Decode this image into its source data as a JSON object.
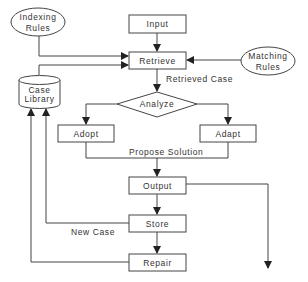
{
  "diagram": {
    "title": "",
    "nodes": {
      "input": {
        "label": "Input",
        "shape": "rect"
      },
      "retrieve": {
        "label": "Retrieve",
        "shape": "rect"
      },
      "indexing_rules": {
        "label_line1": "Indexing",
        "label_line2": "Rules",
        "shape": "ellipse"
      },
      "matching_rules": {
        "label_line1": "Matching",
        "label_line2": "Rules",
        "shape": "ellipse"
      },
      "case_library": {
        "label_line1": "Case",
        "label_line2": "Library",
        "shape": "cylinder"
      },
      "analyze": {
        "label": "Analyze",
        "shape": "diamond"
      },
      "adopt": {
        "label": "Adopt",
        "shape": "rect"
      },
      "adapt": {
        "label": "Adapt",
        "shape": "rect"
      },
      "output": {
        "label": "Output",
        "shape": "rect"
      },
      "store": {
        "label": "Store",
        "shape": "rect"
      },
      "repair": {
        "label": "Repair",
        "shape": "rect"
      }
    },
    "edge_labels": {
      "retrieved_case": "Retrieved Case",
      "propose_solution": "Propose Solution",
      "new_case": "New Case"
    },
    "edges": [
      {
        "from": "input",
        "to": "retrieve"
      },
      {
        "from": "indexing_rules",
        "to": "retrieve"
      },
      {
        "from": "case_library",
        "to": "retrieve"
      },
      {
        "from": "matching_rules",
        "to": "retrieve"
      },
      {
        "from": "retrieve",
        "to": "analyze",
        "label": "Retrieved Case"
      },
      {
        "from": "analyze",
        "to": "adopt"
      },
      {
        "from": "analyze",
        "to": "adapt"
      },
      {
        "from": "adopt",
        "to": "output",
        "label": "Propose Solution"
      },
      {
        "from": "adapt",
        "to": "output",
        "label": "Propose Solution"
      },
      {
        "from": "output",
        "to": "store"
      },
      {
        "from": "output",
        "to": "external"
      },
      {
        "from": "store",
        "to": "repair"
      },
      {
        "from": "store",
        "to": "case_library",
        "label": "New Case"
      },
      {
        "from": "repair",
        "to": "case_library"
      }
    ],
    "colors": {
      "stroke": "#444444",
      "text": "#333333",
      "background": "#ffffff"
    }
  }
}
